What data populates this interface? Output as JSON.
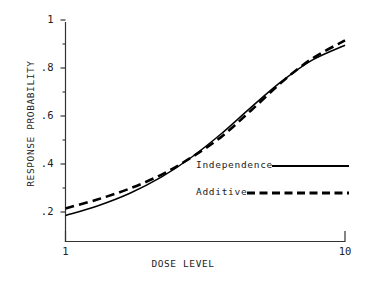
{
  "chart_data": {
    "type": "line",
    "title": "",
    "xlabel": "DOSE LEVEL",
    "ylabel": "RESPONSE PROBABILITY",
    "xscale": "log",
    "xlim": [
      1,
      10
    ],
    "ylim": [
      0.12,
      1.0
    ],
    "grid": false,
    "legend_position": "center-right",
    "xtick_labels": [
      "1",
      "10"
    ],
    "xtick_values": [
      1,
      10
    ],
    "ytick_labels": [
      "1",
      ".8",
      ".6",
      ".4",
      ".2"
    ],
    "ytick_values": [
      1.0,
      0.8,
      0.6,
      0.4,
      0.2
    ],
    "yminor_values": [
      0.9,
      0.7,
      0.5,
      0.3
    ],
    "x": [
      1.0,
      1.3,
      1.7,
      2.2,
      2.8,
      3.6,
      4.6,
      5.9,
      7.6,
      10.0
    ],
    "series": [
      {
        "name": "Independence",
        "style": "solid",
        "color": "#000000",
        "values": [
          0.185,
          0.225,
          0.278,
          0.345,
          0.425,
          0.525,
          0.635,
          0.742,
          0.832,
          0.895
        ]
      },
      {
        "name": "Additive",
        "style": "dashed",
        "color": "#000000",
        "values": [
          0.215,
          0.252,
          0.298,
          0.355,
          0.425,
          0.512,
          0.622,
          0.738,
          0.838,
          0.915
        ]
      }
    ],
    "annotations": []
  },
  "legend": {
    "items": [
      {
        "label": "Independence",
        "style": "solid"
      },
      {
        "label": "Additive",
        "style": "dashed"
      }
    ]
  },
  "axes": {
    "x_axis_label": "DOSE LEVEL",
    "y_axis_label": "RESPONSE PROBABILITY"
  }
}
